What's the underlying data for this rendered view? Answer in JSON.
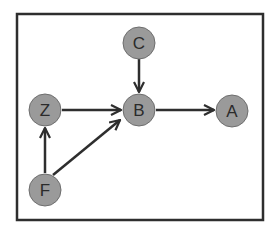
{
  "diagram": {
    "type": "directed-graph",
    "colors": {
      "node_fill": "#9a9a9a",
      "node_stroke": "#6e6e6e",
      "edge": "#2e2e2e",
      "frame": "#2e2e2e"
    },
    "nodes": [
      {
        "id": "C",
        "label": "C",
        "x": 139,
        "y": 43
      },
      {
        "id": "Z",
        "label": "Z",
        "x": 45,
        "y": 110
      },
      {
        "id": "B",
        "label": "B",
        "x": 139,
        "y": 110
      },
      {
        "id": "A",
        "label": "A",
        "x": 232,
        "y": 111
      },
      {
        "id": "F",
        "label": "F",
        "x": 45,
        "y": 190
      }
    ],
    "edges": [
      {
        "from": "C",
        "to": "B"
      },
      {
        "from": "Z",
        "to": "B"
      },
      {
        "from": "B",
        "to": "A"
      },
      {
        "from": "F",
        "to": "Z"
      },
      {
        "from": "F",
        "to": "B"
      }
    ]
  }
}
